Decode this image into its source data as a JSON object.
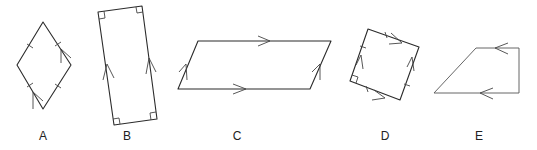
{
  "diagram": {
    "line_color": "#2b2b2b",
    "shapes": [
      {
        "id": "A",
        "label": "A",
        "type": "rhombus",
        "markings": [
          "equal-side ticks on all four sides",
          "parallel arrows on two opposite sides"
        ]
      },
      {
        "id": "B",
        "label": "B",
        "type": "rectangle",
        "markings": [
          "right-angle marks on all four corners",
          "parallel arrows on long sides"
        ]
      },
      {
        "id": "C",
        "label": "C",
        "type": "parallelogram",
        "markings": [
          "single arrows on top and bottom",
          "single arrows on slanted sides"
        ]
      },
      {
        "id": "D",
        "label": "D",
        "type": "square-like quadrilateral",
        "markings": [
          "right-angle mark at bottom-left",
          "equal-side ticks",
          "parallel arrows on both pairs"
        ]
      },
      {
        "id": "E",
        "label": "E",
        "type": "trapezoid",
        "markings": [
          "parallel arrows on top and bottom"
        ]
      }
    ]
  }
}
